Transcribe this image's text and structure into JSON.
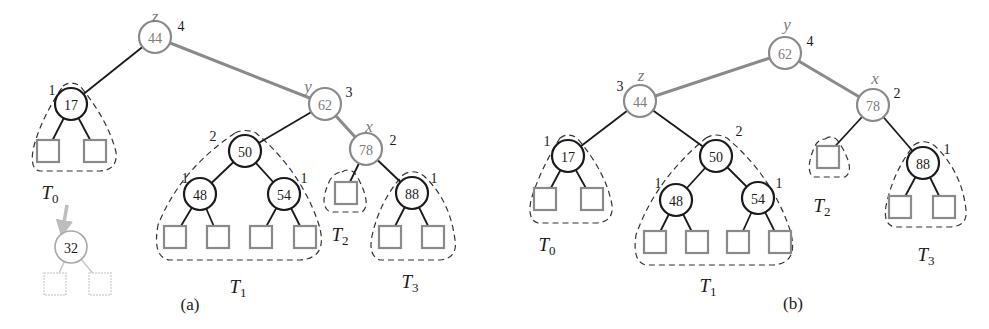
{
  "figure": {
    "colors": {
      "black": "#1a1a1a",
      "gray": "#8a8a8a",
      "gray_text": "#7a7a7a",
      "light_gray": "#c8c8c8",
      "dash": "#333333"
    },
    "panels": [
      {
        "id": "a",
        "caption": "(a)",
        "caption_pos": [
          190,
          304
        ],
        "nodes": [
          {
            "key": "44",
            "x": 155,
            "y": 37,
            "style": "gray",
            "height": "4",
            "height_pos": [
              181,
              26
            ],
            "var": "z",
            "var_pos": [
              155,
              16
            ]
          },
          {
            "key": "17",
            "x": 71,
            "y": 104,
            "style": "black",
            "height": "1",
            "height_pos": [
              52,
              90
            ]
          },
          {
            "key": "62",
            "x": 325,
            "y": 104,
            "style": "gray",
            "height": "3",
            "height_pos": [
              349,
              92
            ],
            "var": "y",
            "var_pos": [
              308,
              86
            ]
          },
          {
            "key": "50",
            "x": 245,
            "y": 151,
            "style": "black",
            "height": "2",
            "height_pos": [
              213,
              136
            ]
          },
          {
            "key": "78",
            "x": 366,
            "y": 149,
            "style": "gray",
            "height": "2",
            "height_pos": [
              393,
              140
            ],
            "var": "x",
            "var_pos": [
              369,
              126
            ]
          },
          {
            "key": "48",
            "x": 200,
            "y": 194,
            "style": "black",
            "height": "1",
            "height_pos": [
              185,
              178
            ]
          },
          {
            "key": "54",
            "x": 284,
            "y": 194,
            "style": "black",
            "height": "1",
            "height_pos": [
              304,
              178
            ]
          },
          {
            "key": "88",
            "x": 412,
            "y": 193,
            "style": "black",
            "height": "1",
            "height_pos": [
              434,
              178
            ]
          },
          {
            "key": "32",
            "x": 71,
            "y": 247,
            "style": "faded"
          }
        ],
        "edges": [
          {
            "from": [
              155,
              37
            ],
            "to": [
              71,
              104
            ],
            "style": "black"
          },
          {
            "from": [
              155,
              37
            ],
            "to": [
              325,
              104
            ],
            "style": "gray"
          },
          {
            "from": [
              325,
              104
            ],
            "to": [
              245,
              151
            ],
            "style": "black"
          },
          {
            "from": [
              325,
              104
            ],
            "to": [
              366,
              149
            ],
            "style": "gray"
          },
          {
            "from": [
              71,
              104
            ],
            "to": [
              48,
              149
            ],
            "style": "black"
          },
          {
            "from": [
              71,
              104
            ],
            "to": [
              95,
              149
            ],
            "style": "black"
          },
          {
            "from": [
              245,
              151
            ],
            "to": [
              200,
              194
            ],
            "style": "black"
          },
          {
            "from": [
              245,
              151
            ],
            "to": [
              284,
              194
            ],
            "style": "black"
          },
          {
            "from": [
              200,
              194
            ],
            "to": [
              175,
              236
            ],
            "style": "black"
          },
          {
            "from": [
              200,
              194
            ],
            "to": [
              218,
              236
            ],
            "style": "black"
          },
          {
            "from": [
              284,
              194
            ],
            "to": [
              261,
              236
            ],
            "style": "black"
          },
          {
            "from": [
              284,
              194
            ],
            "to": [
              305,
              236
            ],
            "style": "black"
          },
          {
            "from": [
              366,
              149
            ],
            "to": [
              346,
              190
            ],
            "style": "black"
          },
          {
            "from": [
              366,
              149
            ],
            "to": [
              412,
              193
            ],
            "style": "black"
          },
          {
            "from": [
              412,
              193
            ],
            "to": [
              390,
              236
            ],
            "style": "black"
          },
          {
            "from": [
              412,
              193
            ],
            "to": [
              433,
              236
            ],
            "style": "black"
          },
          {
            "from": [
              71,
              247
            ],
            "to": [
              55,
              282
            ],
            "style": "faded"
          },
          {
            "from": [
              71,
              247
            ],
            "to": [
              100,
              282
            ],
            "style": "faded"
          }
        ],
        "leaves": [
          {
            "x": 48,
            "y": 151,
            "style": "gray"
          },
          {
            "x": 95,
            "y": 151,
            "style": "gray"
          },
          {
            "x": 175,
            "y": 237,
            "style": "gray"
          },
          {
            "x": 218,
            "y": 237,
            "style": "gray"
          },
          {
            "x": 261,
            "y": 237,
            "style": "gray"
          },
          {
            "x": 305,
            "y": 237,
            "style": "gray"
          },
          {
            "x": 346,
            "y": 193,
            "style": "gray"
          },
          {
            "x": 390,
            "y": 237,
            "style": "gray"
          },
          {
            "x": 433,
            "y": 237,
            "style": "gray"
          },
          {
            "x": 55,
            "y": 284,
            "style": "faded"
          },
          {
            "x": 100,
            "y": 284,
            "style": "faded"
          }
        ],
        "subtrees": [
          {
            "name": "T",
            "sub": "0",
            "label_pos": [
              50,
              192
            ],
            "path": "M 63 86 Q 71 80 80 86 Q 108 120 116 152 Q 118 170 100 171 L 40 171 Q 30 170 33 150 Q 40 120 63 86 Z"
          },
          {
            "name": "T",
            "sub": "1",
            "label_pos": [
              238,
              286
            ],
            "path": "M 235 133 Q 245 128 256 133 Q 300 170 318 222 Q 330 258 300 260 L 170 260 Q 152 258 158 225 Q 180 170 235 133 Z"
          },
          {
            "name": "T",
            "sub": "2",
            "label_pos": [
              340,
              234
            ],
            "path": "M 342 172 Q 352 166 358 178 Q 372 205 362 212 L 330 212 Q 318 205 330 180 Q 335 172 342 172 Z"
          },
          {
            "name": "T",
            "sub": "3",
            "label_pos": [
              410,
              281
            ],
            "path": "M 403 175 Q 413 168 424 176 Q 450 200 455 240 Q 458 258 440 260 L 380 260 Q 368 256 372 236 Q 380 200 403 175 Z"
          }
        ],
        "arrow": {
          "from": [
            67,
            205
          ],
          "to": [
            62,
            234
          ]
        }
      },
      {
        "id": "b",
        "caption": "(b)",
        "caption_pos": [
          793,
          303
        ],
        "nodes": [
          {
            "key": "62",
            "x": 785,
            "y": 53,
            "style": "gray",
            "height": "4",
            "height_pos": [
              810,
              41
            ],
            "var": "y",
            "var_pos": [
              787,
              24
            ]
          },
          {
            "key": "44",
            "x": 640,
            "y": 101,
            "style": "gray",
            "height": "3",
            "height_pos": [
              620,
              86
            ],
            "var": "z",
            "var_pos": [
              641,
              75
            ]
          },
          {
            "key": "78",
            "x": 873,
            "y": 105,
            "style": "gray",
            "height": "2",
            "height_pos": [
              897,
              93
            ],
            "var": "x",
            "var_pos": [
              875,
              78
            ]
          },
          {
            "key": "17",
            "x": 568,
            "y": 156,
            "style": "black",
            "height": "1",
            "height_pos": [
              547,
              141
            ]
          },
          {
            "key": "50",
            "x": 716,
            "y": 156,
            "style": "black",
            "height": "2",
            "height_pos": [
              739,
              131
            ]
          },
          {
            "key": "48",
            "x": 676,
            "y": 200,
            "style": "black",
            "height": "1",
            "height_pos": [
              658,
              183
            ]
          },
          {
            "key": "54",
            "x": 758,
            "y": 198,
            "style": "black",
            "height": "1",
            "height_pos": [
              779,
              183
            ]
          },
          {
            "key": "88",
            "x": 923,
            "y": 163,
            "style": "black",
            "height": "1",
            "height_pos": [
              947,
              149
            ]
          }
        ],
        "edges": [
          {
            "from": [
              785,
              53
            ],
            "to": [
              640,
              101
            ],
            "style": "gray"
          },
          {
            "from": [
              785,
              53
            ],
            "to": [
              873,
              105
            ],
            "style": "gray"
          },
          {
            "from": [
              640,
              101
            ],
            "to": [
              568,
              156
            ],
            "style": "black"
          },
          {
            "from": [
              640,
              101
            ],
            "to": [
              716,
              156
            ],
            "style": "black"
          },
          {
            "from": [
              568,
              156
            ],
            "to": [
              545,
              199
            ],
            "style": "black"
          },
          {
            "from": [
              568,
              156
            ],
            "to": [
              592,
              199
            ],
            "style": "black"
          },
          {
            "from": [
              716,
              156
            ],
            "to": [
              676,
              200
            ],
            "style": "black"
          },
          {
            "from": [
              716,
              156
            ],
            "to": [
              758,
              198
            ],
            "style": "black"
          },
          {
            "from": [
              676,
              200
            ],
            "to": [
              655,
              242
            ],
            "style": "black"
          },
          {
            "from": [
              676,
              200
            ],
            "to": [
              697,
              242
            ],
            "style": "black"
          },
          {
            "from": [
              758,
              198
            ],
            "to": [
              738,
              242
            ],
            "style": "black"
          },
          {
            "from": [
              758,
              198
            ],
            "to": [
              780,
              242
            ],
            "style": "black"
          },
          {
            "from": [
              873,
              105
            ],
            "to": [
              828,
              154
            ],
            "style": "black"
          },
          {
            "from": [
              873,
              105
            ],
            "to": [
              923,
              163
            ],
            "style": "black"
          },
          {
            "from": [
              923,
              163
            ],
            "to": [
              900,
              206
            ],
            "style": "black"
          },
          {
            "from": [
              923,
              163
            ],
            "to": [
              944,
              206
            ],
            "style": "black"
          }
        ],
        "leaves": [
          {
            "x": 545,
            "y": 199,
            "style": "gray"
          },
          {
            "x": 592,
            "y": 199,
            "style": "gray"
          },
          {
            "x": 655,
            "y": 242,
            "style": "gray"
          },
          {
            "x": 697,
            "y": 242,
            "style": "gray"
          },
          {
            "x": 738,
            "y": 242,
            "style": "gray"
          },
          {
            "x": 780,
            "y": 242,
            "style": "gray"
          },
          {
            "x": 828,
            "y": 157,
            "style": "gray"
          },
          {
            "x": 900,
            "y": 207,
            "style": "gray"
          },
          {
            "x": 944,
            "y": 207,
            "style": "gray"
          }
        ],
        "subtrees": [
          {
            "name": "T",
            "sub": "0",
            "label_pos": [
              547,
              244
            ],
            "path": "M 560 138 Q 568 132 577 138 Q 606 172 612 205 Q 614 222 596 223 L 538 223 Q 527 220 531 200 Q 540 170 560 138 Z"
          },
          {
            "name": "T",
            "sub": "1",
            "label_pos": [
              708,
              285
            ],
            "path": "M 706 138 Q 716 132 727 138 Q 772 176 790 230 Q 800 264 772 265 L 646 265 Q 632 262 636 235 Q 655 180 706 138 Z"
          },
          {
            "name": "T",
            "sub": "2",
            "label_pos": [
              822,
              205
            ],
            "path": "M 825 139 Q 834 133 840 144 Q 856 170 845 177 L 813 177 Q 805 170 814 148 Q 818 139 825 139 Z"
          },
          {
            "name": "T",
            "sub": "3",
            "label_pos": [
              926,
              254
            ],
            "path": "M 914 145 Q 924 138 935 146 Q 962 172 966 210 Q 968 226 950 227 L 894 227 Q 883 224 886 206 Q 893 172 914 145 Z"
          }
        ]
      }
    ]
  }
}
